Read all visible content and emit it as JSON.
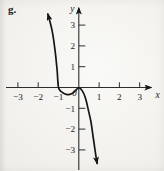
{
  "figure_label": "g.",
  "colors": {
    "paper": "#f5f4ef",
    "axis_ink": "#2d2d2d",
    "curve_ink": "#161616",
    "text_ink": "#222222"
  },
  "chart_data": {
    "type": "line",
    "title": "",
    "xlabel": "x",
    "ylabel": "y",
    "origin_label": "0",
    "xlim": [
      -3.6,
      3.7
    ],
    "ylim": [
      -3.9,
      4.0
    ],
    "grid": false,
    "legend": "none",
    "x_ticks": [
      -3,
      -2,
      -1,
      1,
      2,
      3
    ],
    "y_ticks": [
      3,
      2,
      1,
      -1,
      -2,
      -3
    ],
    "x_intercepts": [
      -1,
      0
    ],
    "series": [
      {
        "name": "g",
        "arrows": "both",
        "points": [
          [
            -1.52,
            3.53
          ],
          [
            -1.32,
            2.76
          ],
          [
            -1.17,
            1.8
          ],
          [
            -1.07,
            0.84
          ],
          [
            -1.0,
            0.0
          ],
          [
            -0.83,
            -0.22
          ],
          [
            -0.58,
            -0.34
          ],
          [
            -0.33,
            -0.29
          ],
          [
            -0.14,
            -0.12
          ],
          [
            0.0,
            -0.01
          ],
          [
            0.16,
            -0.14
          ],
          [
            0.31,
            -0.46
          ],
          [
            0.45,
            -0.99
          ],
          [
            0.6,
            -1.66
          ],
          [
            0.7,
            -2.33
          ],
          [
            0.8,
            -3.0
          ],
          [
            0.9,
            -3.65
          ]
        ]
      }
    ]
  }
}
